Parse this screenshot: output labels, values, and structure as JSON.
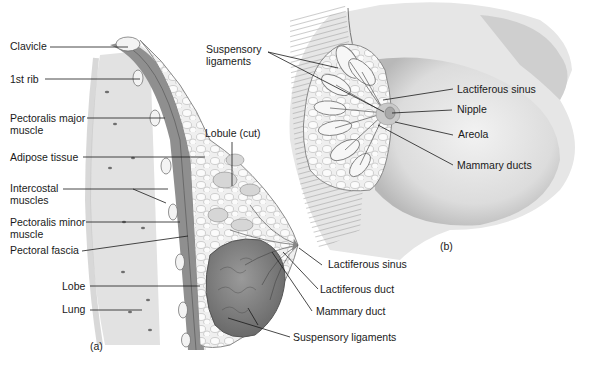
{
  "figure": {
    "panel_a": {
      "tag": "(a)",
      "labels": {
        "clavicle": "Clavicle",
        "first_rib": "1st rib",
        "pectoralis_major_1": "Pectoralis major",
        "pectoralis_major_2": "muscle",
        "adipose": "Adipose tissue",
        "intercostal_1": "Intercostal",
        "intercostal_2": "muscles",
        "pectoralis_minor_1": "Pectoralis minor",
        "pectoralis_minor_2": "muscle",
        "pectoral_fascia": "Pectoral fascia",
        "lobe": "Lobe",
        "lung": "Lung",
        "lobule_cut": "Lobule (cut)",
        "lactiferous_sinus": "Lactiferous sinus",
        "lactiferous_duct": "Lactiferous duct",
        "mammary_duct": "Mammary duct",
        "suspensory_ligaments": "Suspensory ligaments"
      }
    },
    "panel_b": {
      "tag": "(b)",
      "labels": {
        "suspensory_1": "Suspensory",
        "suspensory_2": "ligaments",
        "lactiferous_sinus": "Lactiferous sinus",
        "nipple": "Nipple",
        "areola": "Areola",
        "mammary_ducts": "Mammary ducts"
      }
    }
  }
}
